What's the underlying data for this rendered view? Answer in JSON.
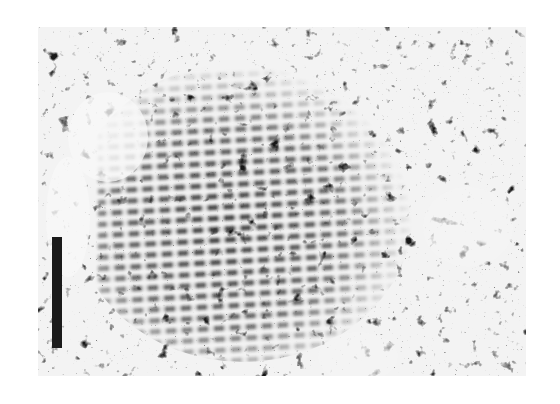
{
  "figure": {
    "type": "transmission electron micrograph",
    "colors": {
      "background": "#ffffff",
      "dark": "#1a1a1a",
      "light": "#f2f2f2"
    },
    "scale_bar": {
      "orientation": "vertical",
      "label": ""
    }
  }
}
